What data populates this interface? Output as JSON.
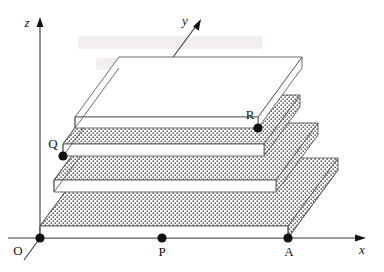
{
  "figure": {
    "background_color": "#ffffff",
    "line_color": "#555a5e",
    "axis_color": "#3a3a3a",
    "point_color": "#111111",
    "hatch_style": "dotted-stipple"
  },
  "axes": {
    "x": {
      "label": "x",
      "style": "italic",
      "arrow": true
    },
    "y": {
      "label": "y",
      "style": "italic",
      "arrow": true
    },
    "z": {
      "label": "z",
      "style": "italic",
      "arrow": true
    }
  },
  "points": [
    {
      "id": "O",
      "label": "O",
      "marked": true
    },
    {
      "id": "P",
      "label": "P",
      "marked": true
    },
    {
      "id": "A",
      "label": "A",
      "marked": true
    },
    {
      "id": "Q",
      "label": "Q",
      "marked": true
    },
    {
      "id": "R",
      "label": "R",
      "marked": true
    }
  ],
  "solid": {
    "description": "Four stacked rectangular slabs forming a stepped pyramid",
    "slab_count": 4
  }
}
